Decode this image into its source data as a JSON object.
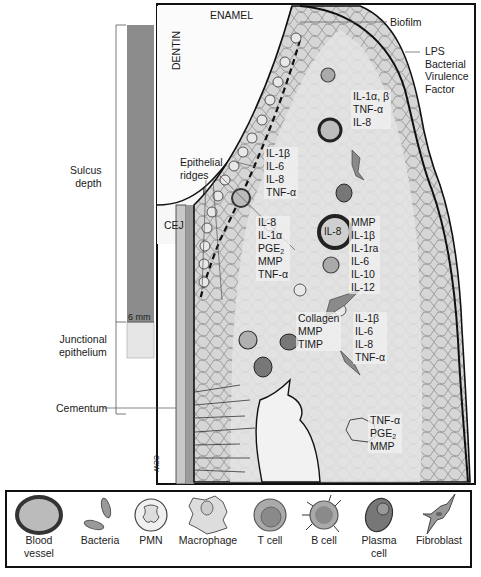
{
  "diagram": {
    "structure_labels": {
      "enamel": "ENAMEL",
      "dentin": "DENTIN",
      "cej": "CEJ",
      "biofilm": "Biofilm",
      "lps": "LPS\nBacterial\nVirulence\nFactor",
      "epithelial_ridges": "Epithelial\nridges",
      "cementum": "Cementum",
      "sulcus_depth": "Sulcus\ndepth",
      "junctional_epithelium": "Junctional\nepithelium",
      "scale_mark": "6 mm",
      "credit": "CCW"
    },
    "cytokine_groups": [
      {
        "id": "top-right",
        "lines": [
          "IL-1α, β",
          "TNF-α",
          "IL-8"
        ]
      },
      {
        "id": "upper-mid",
        "lines": [
          "IL-1β",
          "IL-6",
          "IL-8",
          "TNF-α"
        ]
      },
      {
        "id": "mid-left",
        "lines": [
          "IL-8",
          "IL-1α",
          "PGE2",
          "MMP",
          "TNF-α"
        ]
      },
      {
        "id": "mid-right",
        "lines": [
          "MMP",
          "IL-1β",
          "IL-1ra",
          "IL-6",
          "IL-10",
          "IL-12"
        ]
      },
      {
        "id": "lower-left",
        "lines": [
          "Collagen",
          "MMP",
          "TIMP"
        ]
      },
      {
        "id": "lower-right",
        "lines": [
          "IL-1β",
          "IL-6",
          "IL-8",
          "TNF-α"
        ]
      },
      {
        "id": "bottom",
        "lines": [
          "TNF-α",
          "PGE2",
          "MMP"
        ]
      }
    ],
    "blood_vessel_label": "IL-8"
  },
  "legend": {
    "items": [
      {
        "name": "blood-vessel",
        "label": "Blood\nvessel"
      },
      {
        "name": "bacteria",
        "label": "Bacteria"
      },
      {
        "name": "pmn",
        "label": "PMN"
      },
      {
        "name": "macrophage",
        "label": "Macrophage"
      },
      {
        "name": "t-cell",
        "label": "T cell"
      },
      {
        "name": "b-cell",
        "label": "B cell"
      },
      {
        "name": "plasma-cell",
        "label": "Plasma\ncell"
      },
      {
        "name": "fibroblast",
        "label": "Fibroblast"
      }
    ]
  },
  "colors": {
    "tissue": "#d4d4d4",
    "scale_bar_dark": "#8c8c8c",
    "scale_bar_light": "#e6e6e6",
    "outline": "#111111"
  }
}
